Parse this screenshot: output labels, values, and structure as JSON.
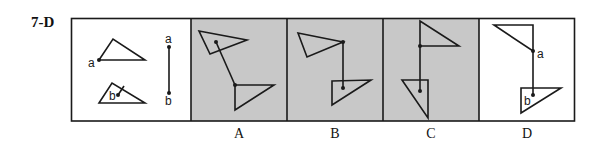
{
  "question": {
    "label": "7-D"
  },
  "reference_panel": {
    "point_a_label": "a",
    "point_b_label": "b",
    "segment_a_label": "a",
    "segment_b_label": "b"
  },
  "options": [
    {
      "label": "A",
      "shaded": true
    },
    {
      "label": "B",
      "shaded": true
    },
    {
      "label": "C",
      "shaded": true
    },
    {
      "label": "D",
      "shaded": false,
      "point_a_label": "a",
      "point_b_label": "b"
    }
  ],
  "colors": {
    "shade": "#c8c8c8",
    "line": "#1a1a1a",
    "background": "#ffffff"
  }
}
